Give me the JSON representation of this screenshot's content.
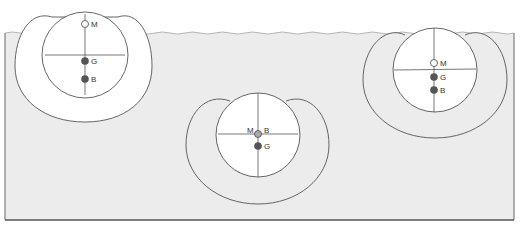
{
  "diagram": {
    "colors": {
      "water": "#ececec",
      "stroke": "#555555",
      "body_fill": "#ffffff",
      "point_filled": "#555555",
      "point_open": "#ffffff"
    },
    "figures": [
      {
        "id": "left",
        "state": "floating high",
        "labels": {
          "M": "M",
          "G": "G",
          "B": "B"
        }
      },
      {
        "id": "middle",
        "state": "fully submerged",
        "labels": {
          "M": "M",
          "B": "B",
          "G": "G"
        }
      },
      {
        "id": "right",
        "state": "floating low",
        "labels": {
          "M": "M",
          "G": "G",
          "B": "B"
        }
      }
    ]
  }
}
